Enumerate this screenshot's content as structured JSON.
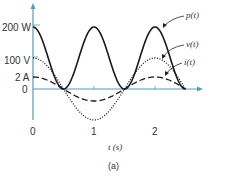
{
  "chart_data": {
    "type": "line",
    "title": "",
    "caption": "(a)",
    "xlabel": "t (s)",
    "ylabel": "",
    "x_ticks": [
      "0",
      "1",
      "2"
    ],
    "y_ticks": [
      "0",
      "2 A",
      "100 V",
      "200 W"
    ],
    "xlim": [
      0,
      2.5
    ],
    "grid": false,
    "series": [
      {
        "name": "p(t)",
        "style": "solid",
        "unit": "W",
        "formula": "100 + 100cos(2πt)",
        "x": [
          0,
          0.5,
          1,
          1.5,
          2,
          2.5
        ],
        "values": [
          200,
          0,
          200,
          0,
          200,
          0
        ]
      },
      {
        "name": "v(t)",
        "style": "dotted",
        "unit": "V",
        "formula": "100cos(πt)",
        "x": [
          0,
          0.5,
          1,
          1.5,
          2,
          2.5
        ],
        "values": [
          100,
          0,
          -100,
          0,
          100,
          0
        ]
      },
      {
        "name": "i(t)",
        "style": "dashed",
        "unit": "A",
        "formula": "2cos(πt)",
        "x": [
          0,
          0.5,
          1,
          1.5,
          2,
          2.5
        ],
        "values": [
          2,
          0,
          -2,
          0,
          2,
          0
        ]
      }
    ]
  },
  "labels": {
    "p": "p(t)",
    "v": "v(t)",
    "i": "i(t)",
    "xlabel": "t (s)",
    "caption": "(a)",
    "y200": "200 W",
    "y100": "100 V",
    "y2": "2 A",
    "y0": "0",
    "x0": "0",
    "x1": "1",
    "x2": "2"
  },
  "colors": {
    "axis": "#5b9bb0",
    "curve": "#1a1a1a"
  }
}
